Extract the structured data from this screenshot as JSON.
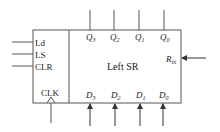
{
  "diagram": {
    "type": "block-diagram",
    "title": "Left SR",
    "colors": {
      "stroke": "#555555",
      "text": "#222222",
      "background": "#ffffff"
    },
    "control_inputs": [
      {
        "label": "Ld"
      },
      {
        "label": "LS"
      },
      {
        "label": "CLR"
      }
    ],
    "clock": {
      "label": "CLK"
    },
    "outputs": [
      {
        "name": "Q",
        "sub": "3"
      },
      {
        "name": "Q",
        "sub": "2"
      },
      {
        "name": "Q",
        "sub": "1"
      },
      {
        "name": "Q",
        "sub": "0"
      }
    ],
    "data_inputs": [
      {
        "name": "D",
        "sub": "3"
      },
      {
        "name": "D",
        "sub": "2"
      },
      {
        "name": "D",
        "sub": "1"
      },
      {
        "name": "D",
        "sub": "0"
      }
    ],
    "serial_input": {
      "name": "R",
      "sub": "in"
    }
  }
}
